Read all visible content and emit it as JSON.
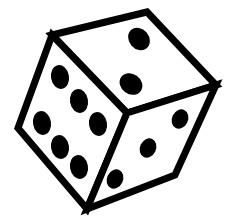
{
  "image": {
    "subject": "die",
    "description": "Black and white line drawing of a six-sided die in perspective",
    "width": 238,
    "height": 224,
    "colors": {
      "background": "#ffffff",
      "ink": "#000000",
      "face_fill": "#ffffff"
    },
    "stroke_width": 7,
    "vertices": {
      "top_left": [
        52,
        35
      ],
      "top_right": [
        147,
        12
      ],
      "right": [
        216,
        85
      ],
      "center": [
        127,
        113
      ],
      "left": [
        18,
        128
      ],
      "bottom": [
        87,
        209
      ],
      "bottom_right": [
        175,
        175
      ]
    },
    "faces": [
      {
        "name": "top",
        "value": 2,
        "pips": [
          {
            "cx": 139,
            "cy": 39,
            "rx": 10,
            "ry": 12,
            "rot": -40
          },
          {
            "cx": 131,
            "cy": 84,
            "rx": 10,
            "ry": 12,
            "rot": -55
          }
        ]
      },
      {
        "name": "left",
        "value": 6,
        "pips": [
          {
            "cx": 60,
            "cy": 77,
            "rx": 9,
            "ry": 12,
            "rot": -10
          },
          {
            "cx": 79,
            "cy": 101,
            "rx": 9,
            "ry": 12,
            "rot": -10
          },
          {
            "cx": 98,
            "cy": 124,
            "rx": 9,
            "ry": 12,
            "rot": -10
          },
          {
            "cx": 42,
            "cy": 123,
            "rx": 9,
            "ry": 12,
            "rot": -10
          },
          {
            "cx": 60,
            "cy": 147,
            "rx": 9,
            "ry": 12,
            "rot": -10
          },
          {
            "cx": 79,
            "cy": 167,
            "rx": 9,
            "ry": 12,
            "rot": -10
          }
        ]
      },
      {
        "name": "right",
        "value": 3,
        "pips": [
          {
            "cx": 180,
            "cy": 119,
            "rx": 8,
            "ry": 10,
            "rot": 25
          },
          {
            "cx": 148,
            "cy": 148,
            "rx": 8,
            "ry": 10,
            "rot": 25
          },
          {
            "cx": 115,
            "cy": 179,
            "rx": 8,
            "ry": 10,
            "rot": 25
          }
        ]
      }
    ]
  }
}
